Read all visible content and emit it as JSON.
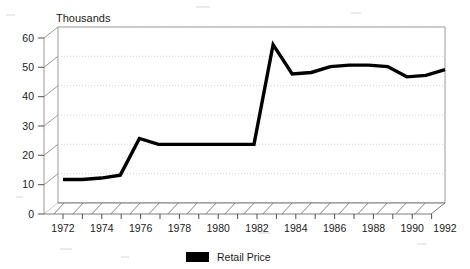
{
  "chart_data": {
    "type": "line",
    "title": "Thousands",
    "xlabel": "",
    "ylabel": "",
    "ylim": [
      0,
      60
    ],
    "yticks": [
      0,
      10,
      20,
      30,
      40,
      50,
      60
    ],
    "xlim": [
      1972,
      1992
    ],
    "xticks": [
      1972,
      1973,
      1974,
      1975,
      1976,
      1977,
      1978,
      1979,
      1980,
      1981,
      1982,
      1983,
      1984,
      1985,
      1986,
      1987,
      1988,
      1989,
      1990,
      1991,
      1992
    ],
    "xtick_labels": [
      "1972",
      "",
      "1974",
      "",
      "1976",
      "",
      "1978",
      "",
      "1980",
      "",
      "1982",
      "",
      "1984",
      "",
      "1986",
      "",
      "1988",
      "",
      "1990",
      "",
      "1992"
    ],
    "grid": true,
    "legend_position": "bottom-center",
    "series": [
      {
        "name": "Retail Price",
        "color": "#000000",
        "x": [
          1972,
          1973,
          1974,
          1975,
          1976,
          1977,
          1978,
          1979,
          1980,
          1981,
          1982,
          1983,
          1984,
          1985,
          1986,
          1987,
          1988,
          1989,
          1990,
          1991,
          1992
        ],
        "values": [
          8,
          8,
          8.5,
          9.5,
          22,
          20,
          20,
          20,
          20,
          20,
          20,
          54,
          44,
          44.5,
          46.5,
          47,
          47,
          46.5,
          43,
          43.5,
          45.5
        ]
      }
    ]
  },
  "chart": {
    "title": "Thousands",
    "y_tick_labels": [
      "60",
      "50",
      "40",
      "30",
      "20",
      "10",
      "0"
    ],
    "x_tick_labels": [
      "1972",
      "1974",
      "1976",
      "1978",
      "1980",
      "1982",
      "1984",
      "1986",
      "1988",
      "1990",
      "1992"
    ]
  },
  "legend": {
    "items": [
      {
        "label": "Retail Price",
        "color": "#000000"
      }
    ]
  }
}
